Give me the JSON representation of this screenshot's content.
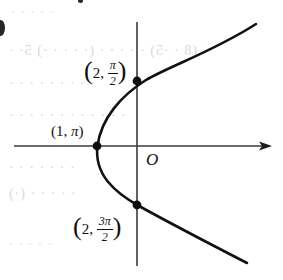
{
  "figure": {
    "kind": "polar-conic-graph",
    "background_color": "#ffffff",
    "ink_color": "#111111",
    "axis_color": "#3a3a3a"
  },
  "axes": {
    "x_axis": {
      "name": "horizontal-axis",
      "y": 146,
      "x_start": 14,
      "x_end": 272,
      "arrow_at_end": true
    },
    "y_axis": {
      "name": "vertical-axis",
      "x": 137,
      "y_start": 22,
      "y_end": 266,
      "arrow_at_end": false
    },
    "origin_label": "O",
    "origin_label_x": 146,
    "origin_label_y": 152
  },
  "points": [
    {
      "name": "point-vertex",
      "label_parts": {
        "r": "1",
        "theta": "π",
        "theta_kind": "plain"
      },
      "label_text": "(1, π)",
      "dot_x": 97,
      "dot_y": 146,
      "label_x": 51,
      "label_y": 125
    },
    {
      "name": "point-upper",
      "label_parts": {
        "r": "2",
        "theta_num": "π",
        "theta_den": "2",
        "theta_kind": "fraction"
      },
      "label_text": "(2, π/2)",
      "dot_x": 137,
      "dot_y": 81,
      "label_x": 84,
      "label_y": 58
    },
    {
      "name": "point-lower",
      "label_parts": {
        "r": "2",
        "theta_num": "3π",
        "theta_den": "2",
        "theta_kind": "fraction"
      },
      "label_text": "(2, 3π/2)",
      "dot_x": 137,
      "dot_y": 205,
      "label_x": 73,
      "label_y": 214
    }
  ],
  "curve": {
    "name": "parabola-curve",
    "stroke_width": 2.6,
    "opens": "left",
    "upper_branch_end": {
      "x": 256,
      "y": 24
    },
    "lower_branch_end": {
      "x": 247,
      "y": 263
    }
  },
  "artifacts": {
    "edge_speck": {
      "x": 0,
      "y": 20,
      "w": 9,
      "h": 16
    },
    "top_speck": {
      "x": 78,
      "y": 0,
      "w": 5,
      "h": 5
    },
    "ghost_rows": [
      {
        "text": "·  ·   ·    ·   ·",
        "x": 10,
        "y": 4,
        "size": 13
      },
      {
        "text": "(8 · ·5) ·  ·  ·  · · (· · ·  · ·) 5· ·",
        "x": 8,
        "y": 43,
        "size": 14
      },
      {
        "text": "·  ·  ·  ·   ·    ·  ·  ·   ·",
        "x": 8,
        "y": 76,
        "size": 14
      },
      {
        "text": "· · ·  · · ·   · · ·  · ·  ·",
        "x": 8,
        "y": 108,
        "size": 14
      },
      {
        "text": "·  ·  ·   ·   ·   ·  ·",
        "x": 8,
        "y": 160,
        "size": 14
      },
      {
        "text": "·  ·   ·   ·  ·  (·)",
        "x": 8,
        "y": 186,
        "size": 14
      },
      {
        "text": "·  ·   ·   ·  ·",
        "x": 8,
        "y": 236,
        "size": 13
      }
    ]
  }
}
